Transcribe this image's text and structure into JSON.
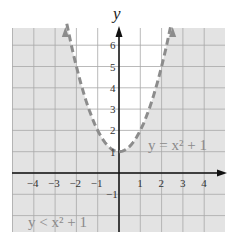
{
  "chart_data": {
    "type": "area",
    "title": "",
    "xlabel": "",
    "ylabel": "y",
    "boundary": {
      "equation": "y = x^2 + 1",
      "style": "dashed",
      "vertex": [
        0,
        1
      ],
      "points": [
        [
          -2.6,
          7.76
        ],
        [
          -2,
          5
        ],
        [
          -1.5,
          3.25
        ],
        [
          -1,
          2
        ],
        [
          -0.5,
          1.25
        ],
        [
          0,
          1
        ],
        [
          0.5,
          1.25
        ],
        [
          1,
          2
        ],
        [
          1.5,
          3.25
        ],
        [
          2,
          5
        ],
        [
          2.6,
          7.76
        ]
      ]
    },
    "inequality": "y < x^2 + 1",
    "shaded_region": "outside/below parabola",
    "x_ticks": [
      -4,
      -3,
      -2,
      -1,
      1,
      2,
      3,
      4
    ],
    "y_ticks": [
      -1,
      1,
      2,
      3,
      4,
      5,
      6
    ],
    "xlim": [
      -5,
      5
    ],
    "ylim": [
      -2.8,
      6.8
    ],
    "grid": true,
    "legend": []
  },
  "labels": {
    "y_axis": "y",
    "boundary_label": "y = x² + 1",
    "inequality_label": "y < x² + 1"
  },
  "colors": {
    "shade": "#e3e3e3",
    "grid": "#a8a8a8",
    "curve": "#8c8c8c",
    "axis": "#111111",
    "label": "#8a8a8a"
  }
}
